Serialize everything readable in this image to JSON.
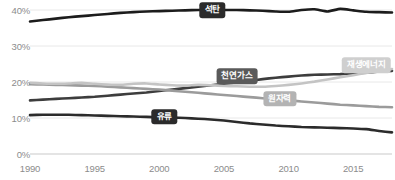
{
  "chart_data": {
    "type": "line",
    "title": "",
    "xlabel": "",
    "ylabel": "",
    "xlim": [
      1990,
      2018
    ],
    "ylim": [
      0,
      44
    ],
    "ytick_values": [
      0,
      10,
      20,
      30,
      40
    ],
    "ytick_labels": [
      "0%",
      "10%",
      "20%",
      "30%",
      "40%"
    ],
    "xtick_values": [
      1990,
      1995,
      2000,
      2005,
      2010,
      2015
    ],
    "xtick_labels": [
      "1990",
      "1995",
      "2000",
      "2005",
      "2010",
      "2015"
    ],
    "grid": true,
    "legend_position": "inline-on-line",
    "x": [
      1990,
      1991,
      1992,
      1993,
      1994,
      1995,
      1996,
      1997,
      1998,
      1999,
      2000,
      2001,
      2002,
      2003,
      2004,
      2005,
      2006,
      2007,
      2008,
      2009,
      2010,
      2011,
      2012,
      2013,
      2014,
      2015,
      2016,
      2017,
      2018
    ],
    "series": [
      {
        "name": "석탄",
        "label": "석탄",
        "color": "#1c1c1c",
        "label_bg": "#2b2b2b",
        "label_fg": "#ffffff",
        "label_x": 2004.1,
        "label_y": 40.0,
        "values": [
          36.8,
          37.2,
          37.6,
          38.0,
          38.3,
          38.6,
          38.9,
          39.2,
          39.4,
          39.6,
          39.7,
          39.8,
          39.9,
          40.0,
          40.0,
          40.0,
          40.0,
          39.9,
          39.8,
          39.6,
          39.5,
          40.0,
          40.2,
          39.6,
          40.3,
          39.9,
          39.5,
          39.4,
          39.3
        ]
      },
      {
        "name": "천연가스",
        "label": "천연가스",
        "color": "#3d3d3d",
        "label_bg": "#5a5a5a",
        "label_fg": "#ffffff",
        "label_x": 2006.0,
        "label_y": 21.6,
        "values": [
          14.9,
          15.1,
          15.3,
          15.5,
          15.7,
          15.9,
          16.2,
          16.5,
          16.8,
          17.1,
          17.5,
          17.9,
          18.3,
          18.7,
          19.1,
          19.5,
          19.9,
          20.3,
          20.8,
          21.2,
          21.5,
          21.8,
          22.0,
          22.1,
          22.2,
          22.4,
          22.6,
          22.9,
          23.1
        ]
      },
      {
        "name": "원자력",
        "label": "원자력",
        "color": "#9b9b9b",
        "label_bg": "#b3b3b3",
        "label_fg": "#ffffff",
        "label_x": 2009.3,
        "label_y": 15.3,
        "values": [
          19.4,
          19.3,
          19.2,
          19.1,
          19.0,
          18.9,
          18.7,
          18.5,
          18.3,
          18.1,
          17.9,
          17.6,
          17.3,
          17.0,
          16.7,
          16.4,
          16.1,
          15.8,
          15.5,
          15.2,
          14.9,
          14.6,
          14.3,
          14.0,
          13.7,
          13.5,
          13.3,
          13.1,
          13.0
        ]
      },
      {
        "name": "재생에너지",
        "label": "재생에너지",
        "color": "#c4c4c4",
        "label_bg": "#cfcfcf",
        "label_fg": "#ffffff",
        "label_x": 2016.0,
        "label_y": 24.6,
        "values": [
          19.8,
          19.6,
          19.5,
          19.6,
          19.8,
          19.5,
          19.3,
          19.2,
          19.5,
          19.6,
          19.3,
          19.1,
          19.0,
          19.2,
          19.1,
          18.9,
          18.8,
          18.7,
          18.7,
          18.9,
          19.2,
          19.6,
          20.1,
          20.7,
          21.3,
          21.9,
          22.5,
          23.1,
          23.6
        ]
      },
      {
        "name": "유류",
        "label": "유류",
        "color": "#2b2b2b",
        "label_bg": "#2b2b2b",
        "label_fg": "#ffffff",
        "label_x": 2000.4,
        "label_y": 10.4,
        "values": [
          10.8,
          10.9,
          10.9,
          10.9,
          10.8,
          10.7,
          10.6,
          10.5,
          10.4,
          10.3,
          10.2,
          10.1,
          10.0,
          9.8,
          9.6,
          9.3,
          8.9,
          8.5,
          8.2,
          7.9,
          7.7,
          7.5,
          7.4,
          7.3,
          7.2,
          7.1,
          6.9,
          6.4,
          6.0
        ]
      }
    ]
  }
}
